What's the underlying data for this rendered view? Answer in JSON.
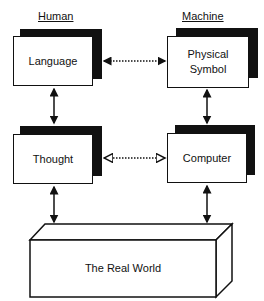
{
  "headers": {
    "left": "Human",
    "right": "Machine"
  },
  "nodes": {
    "language": "Language",
    "physical_symbol_line1": "Physical",
    "physical_symbol_line2": "Symbol",
    "thought": "Thought",
    "computer": "Computer",
    "real_world": "The Real World"
  },
  "connections": [
    {
      "from": "Language",
      "to": "Physical Symbol",
      "style": "dotted",
      "direction": "both"
    },
    {
      "from": "Language",
      "to": "Thought",
      "style": "solid",
      "direction": "both"
    },
    {
      "from": "Physical Symbol",
      "to": "Computer",
      "style": "solid",
      "direction": "both"
    },
    {
      "from": "Thought",
      "to": "Computer",
      "style": "dotted",
      "direction": "both"
    },
    {
      "from": "Thought",
      "to": "The Real World",
      "style": "solid",
      "direction": "both"
    },
    {
      "from": "Computer",
      "to": "The Real World",
      "style": "solid",
      "direction": "both"
    }
  ]
}
